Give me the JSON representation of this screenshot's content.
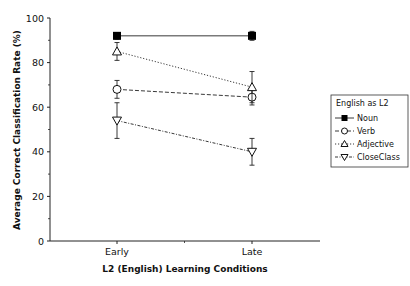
{
  "chart_data": {
    "type": "line",
    "title": "",
    "xlabel": "L2 (English) Learning Conditions",
    "ylabel": "Average Correct Classification Rate (%)",
    "categories": [
      "Early",
      "Late"
    ],
    "ylim": [
      0,
      100
    ],
    "yticks": [
      0,
      20,
      40,
      60,
      80,
      100
    ],
    "grid": false,
    "legend_title": "English as L2",
    "legend_position": "right",
    "series": [
      {
        "name": "Noun",
        "marker": "filled-square",
        "line": "solid",
        "values": [
          92,
          92
        ],
        "error": [
          1.5,
          2
        ]
      },
      {
        "name": "Verb",
        "marker": "open-circle",
        "line": "dashed",
        "values": [
          68,
          64.5
        ],
        "error": [
          4,
          3.5
        ]
      },
      {
        "name": "Adjective",
        "marker": "open-triangle-up",
        "line": "dotted",
        "values": [
          85,
          69
        ],
        "error": [
          4,
          7
        ]
      },
      {
        "name": "CloseClass",
        "marker": "open-triangle-down",
        "line": "dash-dot",
        "values": [
          54,
          40
        ],
        "error": [
          8,
          6
        ]
      }
    ]
  }
}
